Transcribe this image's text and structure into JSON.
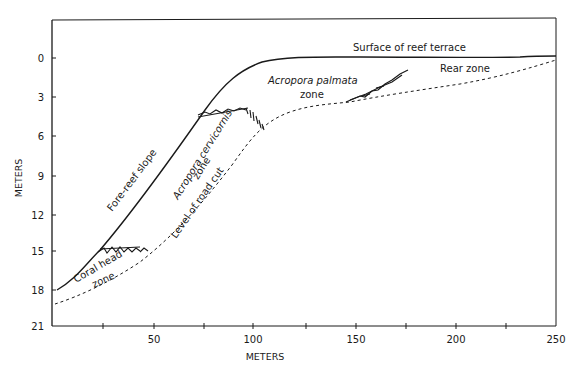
{
  "figure": {
    "y_axis": {
      "title": "METERS",
      "ticks": [
        "0",
        "3",
        "6",
        "9",
        "12",
        "15",
        "18",
        "21"
      ]
    },
    "x_axis": {
      "title": "METERS",
      "ticks": [
        "50",
        "100",
        "150",
        "200",
        "250"
      ]
    },
    "labels": {
      "surface": "Surface of reef terrace",
      "rear_zone": "Rear zone",
      "palmata_line1": "Acropora palmata",
      "palmata_line2": "zone",
      "cervicornis_line1": "Acropora cervicornis",
      "cervicornis_line2": "zone",
      "fore_reef": "Fore-reef slope",
      "road_cut": "Level of road cut",
      "coral_head_line1": "Coral head",
      "coral_head_line2": "zone"
    },
    "colors": {
      "ink": "#1a1a1a",
      "background": "#ffffff"
    }
  }
}
